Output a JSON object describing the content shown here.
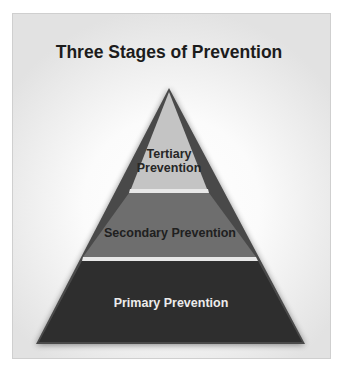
{
  "diagram": {
    "title": "Three Stages of Prevention",
    "levels": [
      {
        "name": "tertiary",
        "label_line1": "Tertiary",
        "label_line2": "Prevention",
        "fill": "#c4c4c4",
        "text_color": "#262626"
      },
      {
        "name": "secondary",
        "label": "Secondary Prevention",
        "fill": "#6e6e6e",
        "text_color": "#202020"
      },
      {
        "name": "primary",
        "label": "Primary Prevention",
        "fill": "#2d2d2d",
        "text_color": "#ececec"
      }
    ],
    "divider_color": "#e8e8e8",
    "outline_color": "#4a4a4a"
  }
}
